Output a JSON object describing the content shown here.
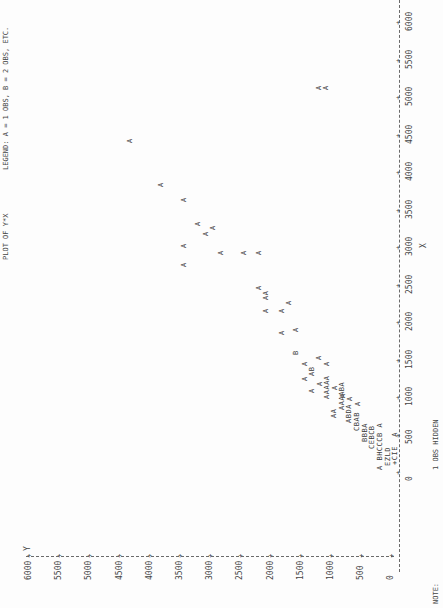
{
  "header": {
    "title": "PLOT OF Y*X",
    "legend": "LEGEND: A = 1 OBS, B = 2 OBS, ETC."
  },
  "footer": {
    "note_label": "NOTE:",
    "note_text": "1 OBS HIDDEN"
  },
  "axes": {
    "y_label": "Y",
    "x_label": "X",
    "y_ticks": [
      "6000",
      "5500",
      "5000",
      "4500",
      "4000",
      "3500",
      "3000",
      "2500",
      "2000",
      "1500",
      "1000",
      "500",
      "0"
    ],
    "x_ticks": [
      "0",
      "500",
      "1000",
      "1500",
      "2000",
      "2500",
      "3000",
      "3500",
      "4000",
      "4500",
      "5000",
      "5500",
      "6000"
    ]
  },
  "plot_glyphs": [
    {
      "t": "A",
      "x": 323,
      "y": 90
    },
    {
      "t": "A",
      "x": 316,
      "y": 90
    },
    {
      "t": "A",
      "x": 127,
      "y": 143
    },
    {
      "t": "A",
      "x": 158,
      "y": 187
    },
    {
      "t": "A",
      "x": 181,
      "y": 202
    },
    {
      "t": "A",
      "x": 195,
      "y": 226
    },
    {
      "t": "A",
      "x": 210,
      "y": 230
    },
    {
      "t": "A",
      "x": 203,
      "y": 236
    },
    {
      "t": "A",
      "x": 181,
      "y": 248
    },
    {
      "t": "A",
      "x": 181,
      "y": 267
    },
    {
      "t": "A",
      "x": 218,
      "y": 255
    },
    {
      "t": "A",
      "x": 241,
      "y": 255
    },
    {
      "t": "A",
      "x": 256,
      "y": 255
    },
    {
      "t": "A",
      "x": 256,
      "y": 290
    },
    {
      "t": "AA",
      "x": 263,
      "y": 300
    },
    {
      "t": "A",
      "x": 286,
      "y": 305
    },
    {
      "t": "A",
      "x": 263,
      "y": 313
    },
    {
      "t": "A",
      "x": 279,
      "y": 313
    },
    {
      "t": "A",
      "x": 279,
      "y": 335
    },
    {
      "t": "A",
      "x": 293,
      "y": 332
    },
    {
      "t": "B",
      "x": 293,
      "y": 355
    },
    {
      "t": "A",
      "x": 316,
      "y": 360
    },
    {
      "t": "A",
      "x": 302,
      "y": 366
    },
    {
      "t": "A",
      "x": 324,
      "y": 366
    },
    {
      "t": "AB",
      "x": 309,
      "y": 376
    },
    {
      "t": "A",
      "x": 302,
      "y": 381
    },
    {
      "t": "A",
      "x": 317,
      "y": 386
    },
    {
      "t": "AAAAA",
      "x": 324,
      "y": 399
    },
    {
      "t": "A",
      "x": 332,
      "y": 390
    },
    {
      "t": "A",
      "x": 309,
      "y": 393
    },
    {
      "t": "A",
      "x": 340,
      "y": 398
    },
    {
      "t": "AAAABA",
      "x": 339,
      "y": 410
    },
    {
      "t": "AA",
      "x": 331,
      "y": 418
    },
    {
      "t": "ABDA",
      "x": 346,
      "y": 423
    },
    {
      "t": "A",
      "x": 347,
      "y": 401
    },
    {
      "t": "A",
      "x": 355,
      "y": 406
    },
    {
      "t": "CBAB",
      "x": 354,
      "y": 431
    },
    {
      "t": "BBBA",
      "x": 362,
      "y": 442
    },
    {
      "t": "CEBCB",
      "x": 369,
      "y": 449
    },
    {
      "t": "A BHCCCB A",
      "x": 377,
      "y": 470
    },
    {
      "t": "EZLD",
      "x": 385,
      "y": 466
    },
    {
      "t": "+CIE  A",
      "x": 392,
      "y": 465
    }
  ],
  "chart_data": {
    "type": "scatter",
    "title": "PLOT OF Y*X",
    "legend": "A = 1 OBS, B = 2 OBS, ETC.",
    "xlabel": "X",
    "ylabel": "Y",
    "xlim": [
      0,
      6000
    ],
    "ylim": [
      0,
      6000
    ],
    "grid": false,
    "orientation_note": "printed line-plot rotated 90 degrees",
    "note": "1 OBS HIDDEN",
    "points": [
      {
        "x": 5100,
        "y": 1150,
        "count": 1
      },
      {
        "x": 5100,
        "y": 1250,
        "count": 1
      },
      {
        "x": 4420,
        "y": 4400,
        "count": 1
      },
      {
        "x": 3830,
        "y": 3870,
        "count": 1
      },
      {
        "x": 3630,
        "y": 3500,
        "count": 1
      },
      {
        "x": 3300,
        "y": 3250,
        "count": 1
      },
      {
        "x": 3250,
        "y": 3020,
        "count": 1
      },
      {
        "x": 3180,
        "y": 3130,
        "count": 1
      },
      {
        "x": 3020,
        "y": 3500,
        "count": 1
      },
      {
        "x": 2750,
        "y": 3500,
        "count": 1
      },
      {
        "x": 2900,
        "y": 2880,
        "count": 1
      },
      {
        "x": 2900,
        "y": 2500,
        "count": 1
      },
      {
        "x": 2900,
        "y": 2250,
        "count": 1
      },
      {
        "x": 2450,
        "y": 2250,
        "count": 1
      },
      {
        "x": 2320,
        "y": 2130,
        "count": 2
      },
      {
        "x": 2250,
        "y": 1750,
        "count": 1
      },
      {
        "x": 2150,
        "y": 2130,
        "count": 1
      },
      {
        "x": 2150,
        "y": 1870,
        "count": 1
      },
      {
        "x": 1880,
        "y": 1870,
        "count": 1
      },
      {
        "x": 1930,
        "y": 1630,
        "count": 1
      },
      {
        "x": 1610,
        "y": 1630,
        "count": 2
      },
      {
        "x": 1550,
        "y": 1250,
        "count": 1
      },
      {
        "x": 1450,
        "y": 1480,
        "count": 1
      },
      {
        "x": 1450,
        "y": 1120,
        "count": 1
      },
      {
        "x": 1300,
        "y": 1370,
        "count": 3
      },
      {
        "x": 1250,
        "y": 1480,
        "count": 1
      },
      {
        "x": 1180,
        "y": 1250,
        "count": 1
      },
      {
        "x": 1100,
        "y": 1120,
        "count": 5
      },
      {
        "x": 1150,
        "y": 1000,
        "count": 1
      },
      {
        "x": 1130,
        "y": 1370,
        "count": 1
      },
      {
        "x": 1100,
        "y": 850,
        "count": 1
      },
      {
        "x": 900,
        "y": 870,
        "count": 7
      },
      {
        "x": 800,
        "y": 1000,
        "count": 2
      },
      {
        "x": 700,
        "y": 750,
        "count": 6
      },
      {
        "x": 960,
        "y": 750,
        "count": 1
      },
      {
        "x": 900,
        "y": 620,
        "count": 1
      },
      {
        "x": 600,
        "y": 620,
        "count": 6
      },
      {
        "x": 450,
        "y": 500,
        "count": 7
      },
      {
        "x": 350,
        "y": 370,
        "count": 11
      },
      {
        "x": 150,
        "y": 250,
        "count": 13
      },
      {
        "x": 100,
        "y": 120,
        "count": 44
      },
      {
        "x": 50,
        "y": 0,
        "count": 17
      }
    ]
  }
}
